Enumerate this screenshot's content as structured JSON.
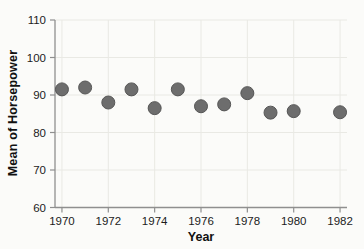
{
  "chart_data": {
    "type": "scatter",
    "title": "",
    "xlabel": "Year",
    "ylabel": "Mean of Horsepower",
    "x": [
      1970,
      1971,
      1972,
      1973,
      1974,
      1975,
      1976,
      1977,
      1978,
      1979,
      1980,
      1982
    ],
    "y": [
      91.5,
      92.0,
      88.0,
      91.5,
      86.5,
      91.5,
      87.0,
      87.5,
      90.5,
      85.3,
      85.7,
      85.4
    ],
    "note": "no data point for 1981",
    "xlim": [
      1969.7,
      1982.3
    ],
    "ylim": [
      60,
      110
    ],
    "x_ticks": [
      1970,
      1972,
      1974,
      1976,
      1978,
      1980,
      1982
    ],
    "y_ticks": [
      60,
      70,
      80,
      90,
      100,
      110
    ],
    "grid": true,
    "legend": false,
    "marker": {
      "shape": "circle",
      "diameter_px": 13,
      "fill": "#6d6d6d",
      "stroke": "#565656"
    },
    "colors": {
      "background": "#fbfbf9",
      "grid": "#e9e9e4",
      "axis": "#8f8f8f",
      "tick_label": "#1c1c1c",
      "axis_title": "#111111"
    }
  }
}
